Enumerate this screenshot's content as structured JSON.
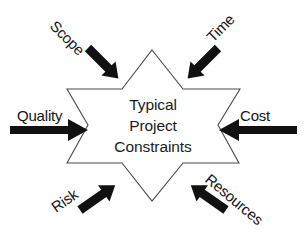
{
  "diagram": {
    "type": "hexagram-constraint-diagram",
    "background_color": "#fefefe",
    "shape_fill": "#ffffff",
    "shape_stroke": "#4a4a4a",
    "arrow_color": "#111111",
    "text_color": "#1a1a1a",
    "center": {
      "line1": "Typical",
      "line2": "Project",
      "line3": "Constraints"
    },
    "constraints": [
      {
        "id": "scope",
        "label": "Scope",
        "position": "top-left",
        "arrow_direction": "down-right",
        "label_rotation_deg": 45
      },
      {
        "id": "time",
        "label": "Time",
        "position": "top-right",
        "arrow_direction": "down-left",
        "label_rotation_deg": -45
      },
      {
        "id": "quality",
        "label": "Quality",
        "position": "left",
        "arrow_direction": "right",
        "label_rotation_deg": 0
      },
      {
        "id": "cost",
        "label": "Cost",
        "position": "right",
        "arrow_direction": "left",
        "label_rotation_deg": 0
      },
      {
        "id": "risk",
        "label": "Risk",
        "position": "bottom-left",
        "arrow_direction": "up-right",
        "label_rotation_deg": -35
      },
      {
        "id": "resources",
        "label": "Resources",
        "position": "bottom-right",
        "arrow_direction": "up-left",
        "label_rotation_deg": 40
      }
    ]
  }
}
